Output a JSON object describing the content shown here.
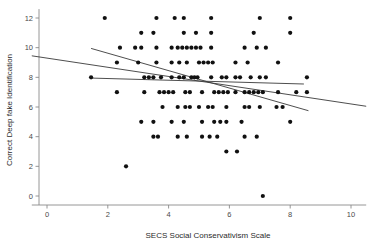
{
  "chart_data": {
    "type": "scatter",
    "title": "",
    "subtitle": "",
    "xlabel": "SECS Social Conservativism Scale",
    "ylabel": "Correct Deep fake Identification",
    "xlim": [
      -0.5,
      10.5
    ],
    "ylim": [
      -0.8,
      12.6
    ],
    "xticks": [
      0,
      2,
      4,
      6,
      8,
      10
    ],
    "xtick_labels": [
      "0",
      "2",
      "4",
      "6",
      "8",
      "10"
    ],
    "yticks": [
      0,
      2,
      4,
      6,
      8,
      10,
      12
    ],
    "ytick_labels": [
      "0",
      "2",
      "4",
      "6",
      "8",
      "10",
      "12"
    ],
    "grid": false,
    "legend": null,
    "marker": "circle",
    "marker_color": "#111111",
    "marker_size": 2.1,
    "points": [
      [
        1.9,
        12
      ],
      [
        3.6,
        12
      ],
      [
        4.2,
        12
      ],
      [
        4.5,
        12
      ],
      [
        5.4,
        12
      ],
      [
        7.0,
        12
      ],
      [
        8.0,
        12
      ],
      [
        3.1,
        11
      ],
      [
        3.5,
        11
      ],
      [
        4.5,
        11
      ],
      [
        4.9,
        11
      ],
      [
        5.4,
        11
      ],
      [
        6.8,
        11
      ],
      [
        8.0,
        11
      ],
      [
        2.4,
        10
      ],
      [
        2.9,
        10
      ],
      [
        3.1,
        10
      ],
      [
        3.6,
        10
      ],
      [
        4.1,
        10
      ],
      [
        4.3,
        10
      ],
      [
        4.45,
        10
      ],
      [
        4.6,
        10
      ],
      [
        4.75,
        10
      ],
      [
        4.9,
        10
      ],
      [
        5.05,
        10
      ],
      [
        5.4,
        10
      ],
      [
        6.5,
        10
      ],
      [
        6.9,
        10
      ],
      [
        7.2,
        10
      ],
      [
        2.3,
        9
      ],
      [
        3.0,
        9
      ],
      [
        3.6,
        9
      ],
      [
        4.1,
        9
      ],
      [
        4.35,
        9
      ],
      [
        4.6,
        9
      ],
      [
        5.0,
        9
      ],
      [
        5.15,
        9
      ],
      [
        5.3,
        9
      ],
      [
        5.45,
        9
      ],
      [
        6.2,
        9
      ],
      [
        6.6,
        9
      ],
      [
        7.6,
        9
      ],
      [
        1.45,
        8
      ],
      [
        3.2,
        8
      ],
      [
        3.35,
        8
      ],
      [
        3.5,
        8
      ],
      [
        3.75,
        8
      ],
      [
        4.1,
        8
      ],
      [
        4.35,
        8
      ],
      [
        4.5,
        8
      ],
      [
        4.75,
        8
      ],
      [
        4.85,
        8
      ],
      [
        4.95,
        8
      ],
      [
        5.4,
        8
      ],
      [
        5.75,
        8
      ],
      [
        5.9,
        8
      ],
      [
        6.2,
        8
      ],
      [
        6.35,
        8
      ],
      [
        6.7,
        8
      ],
      [
        7.0,
        8
      ],
      [
        7.2,
        8
      ],
      [
        8.55,
        8
      ],
      [
        2.3,
        7
      ],
      [
        3.2,
        7
      ],
      [
        3.7,
        7
      ],
      [
        3.85,
        7
      ],
      [
        4.0,
        7
      ],
      [
        4.15,
        7
      ],
      [
        4.55,
        7
      ],
      [
        4.7,
        7
      ],
      [
        5.1,
        7
      ],
      [
        5.5,
        7
      ],
      [
        5.65,
        7
      ],
      [
        5.8,
        7
      ],
      [
        5.95,
        7
      ],
      [
        6.2,
        7
      ],
      [
        6.5,
        7
      ],
      [
        6.65,
        7
      ],
      [
        6.8,
        7
      ],
      [
        6.95,
        7
      ],
      [
        7.1,
        7
      ],
      [
        7.6,
        7
      ],
      [
        8.2,
        7
      ],
      [
        8.55,
        7
      ],
      [
        3.8,
        6
      ],
      [
        4.3,
        6
      ],
      [
        4.55,
        6
      ],
      [
        4.7,
        6
      ],
      [
        5.0,
        6
      ],
      [
        5.3,
        6
      ],
      [
        5.45,
        6
      ],
      [
        5.9,
        6
      ],
      [
        6.5,
        6
      ],
      [
        6.65,
        6
      ],
      [
        7.0,
        6
      ],
      [
        7.55,
        6
      ],
      [
        7.75,
        6
      ],
      [
        3.1,
        5
      ],
      [
        3.5,
        5
      ],
      [
        4.1,
        5
      ],
      [
        4.5,
        5
      ],
      [
        5.1,
        5
      ],
      [
        5.5,
        5
      ],
      [
        5.7,
        5
      ],
      [
        5.9,
        5
      ],
      [
        6.4,
        5
      ],
      [
        8.0,
        5
      ],
      [
        3.5,
        4
      ],
      [
        3.65,
        4
      ],
      [
        4.3,
        4
      ],
      [
        4.6,
        4
      ],
      [
        5.1,
        4
      ],
      [
        5.35,
        4
      ],
      [
        5.6,
        4
      ],
      [
        6.5,
        4
      ],
      [
        6.9,
        4
      ],
      [
        5.9,
        3
      ],
      [
        6.25,
        3
      ],
      [
        2.6,
        2
      ],
      [
        7.1,
        0
      ]
    ],
    "fit_lines": [
      {
        "name": "overall-fit",
        "x_start": -0.5,
        "y_start": 9.45,
        "x_end": 10.5,
        "y_end": 6.05
      },
      {
        "name": "group-fit-steep",
        "x_start": 1.45,
        "y_start": 9.95,
        "x_end": 8.6,
        "y_end": 5.75
      },
      {
        "name": "group-fit-flat",
        "x_start": 1.45,
        "y_start": 7.95,
        "x_end": 8.45,
        "y_end": 7.55
      }
    ]
  }
}
